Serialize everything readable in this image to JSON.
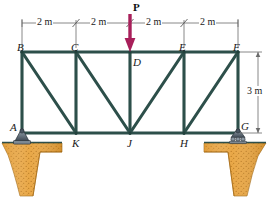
{
  "figure": {
    "type": "statics-truss-free-body-diagram",
    "width": 271,
    "height": 199,
    "background": "#ffffff"
  },
  "colors": {
    "member": "#2d4f4a",
    "member_highlight": "#4e716b",
    "load_arrow": "#a81f5a",
    "dimension_line": "#6b6b6b",
    "soil_fill": "#e8a33d",
    "soil_speckle": "#b9761a",
    "support_body": "#6e7a85",
    "support_dark": "#3d4752",
    "ground_line": "#2d4f4a",
    "label_text": "#1a1a1a"
  },
  "load": {
    "label": "P",
    "applied_at_joint": "D",
    "direction": "down",
    "arrow_color": "#a81f5a"
  },
  "dimensions": {
    "top": {
      "segments": [
        "2 m",
        "2 m",
        "2 m",
        "2 m"
      ],
      "total_span": "8 m",
      "tick_style": "slash"
    },
    "right": {
      "label": "3 m",
      "orientation": "vertical",
      "from_joint": "F",
      "to_joint": "G"
    }
  },
  "joints": {
    "top_chord": [
      {
        "id": "B",
        "x": 22,
        "y": 52,
        "label": "B",
        "label_x": 17,
        "label_y": 42
      },
      {
        "id": "C",
        "x": 76,
        "y": 52,
        "label": "C",
        "label_x": 71,
        "label_y": 42
      },
      {
        "id": "D",
        "x": 130,
        "y": 52,
        "label": "D",
        "label_x": 133,
        "label_y": 57
      },
      {
        "id": "E",
        "x": 184,
        "y": 52,
        "label": "E",
        "label_x": 179,
        "label_y": 42
      },
      {
        "id": "F",
        "x": 238,
        "y": 52,
        "label": "F",
        "label_x": 233,
        "label_y": 42
      }
    ],
    "bottom_chord": [
      {
        "id": "A",
        "x": 22,
        "y": 133,
        "label": "A",
        "label_x": 11,
        "label_y": 127
      },
      {
        "id": "K",
        "x": 76,
        "y": 133,
        "label": "K",
        "label_x": 72,
        "label_y": 140
      },
      {
        "id": "J",
        "x": 130,
        "y": 133,
        "label": "J",
        "label_x": 127,
        "label_y": 140
      },
      {
        "id": "H",
        "x": 184,
        "y": 133,
        "label": "H",
        "label_x": 180,
        "label_y": 140
      },
      {
        "id": "G",
        "x": 238,
        "y": 133,
        "label": "G",
        "label_x": 242,
        "label_y": 126
      }
    ]
  },
  "members": {
    "top_chord": [
      "B-C",
      "C-D",
      "D-E",
      "E-F"
    ],
    "bottom_chord": [
      "A-K",
      "K-J",
      "J-H",
      "H-G"
    ],
    "verticals": [
      "A-B",
      "C-K",
      "D-J",
      "E-H",
      "F-G"
    ],
    "diagonals": [
      "B-K",
      "C-J",
      "J-E",
      "H-F"
    ]
  },
  "supports": [
    {
      "joint": "A",
      "type": "pin-support",
      "side": "left",
      "icon": "pin-support-icon"
    },
    {
      "joint": "G",
      "type": "roller-support",
      "side": "right",
      "icon": "roller-support-icon"
    }
  ],
  "ground": {
    "left_label": "soil-wedge-left",
    "right_label": "soil-wedge-right",
    "hatch": "speckled"
  }
}
